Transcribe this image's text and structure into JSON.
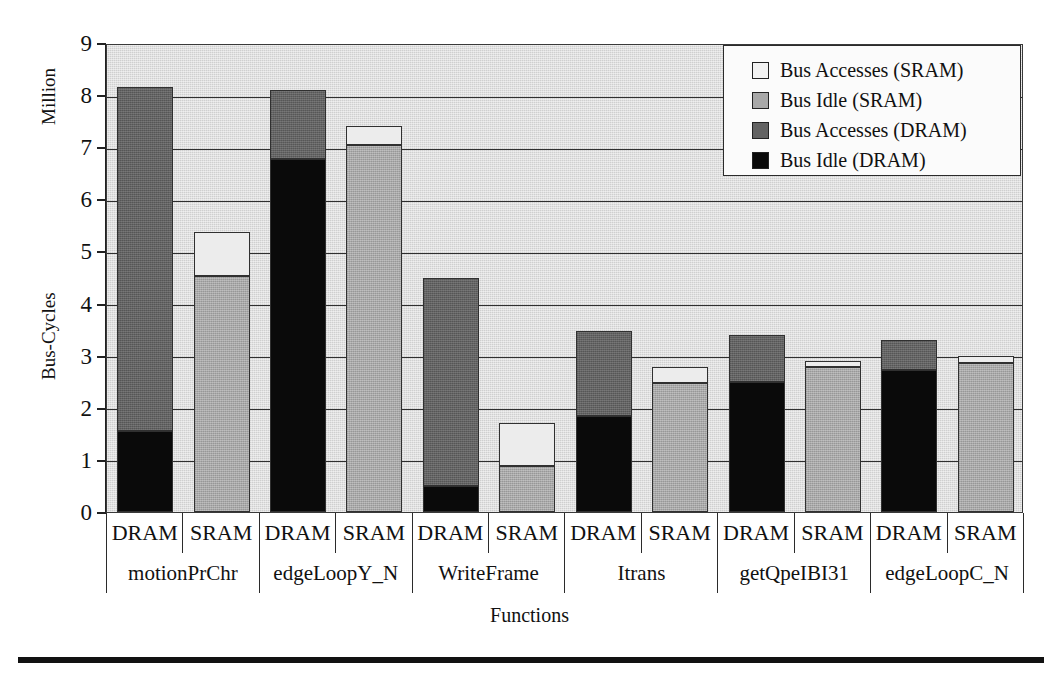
{
  "chart_data": {
    "type": "bar",
    "subtype": "stacked-grouped",
    "title": "",
    "xlabel": "Functions",
    "ylabel": "Bus-Cycles",
    "y_unit_label": "Million",
    "ylim": [
      0,
      9
    ],
    "yticks": [
      0,
      1,
      2,
      3,
      4,
      5,
      6,
      7,
      8,
      9
    ],
    "grid": true,
    "legend_position": "top-right",
    "legend": [
      {
        "label": "Bus Accesses (SRAM)",
        "color": "#f2f2f2",
        "key": "bus_accesses_sram"
      },
      {
        "label": "Bus Idle (SRAM)",
        "color": "#a8a8a8",
        "key": "bus_idle_sram"
      },
      {
        "label": "Bus Accesses (DRAM)",
        "color": "#636363",
        "key": "bus_accesses_dram"
      },
      {
        "label": "Bus Idle (DRAM)",
        "color": "#0a0a0a",
        "key": "bus_idle_dram"
      }
    ],
    "categories": [
      "motionPrChr",
      "edgeLoopY_N",
      "WriteFrame",
      "Itrans",
      "getQpeIBI31",
      "edgeLoopC_N"
    ],
    "memory_types": [
      "DRAM",
      "SRAM"
    ],
    "groups": [
      {
        "function": "motionPrChr",
        "bars": [
          {
            "memory": "DRAM",
            "segments": [
              {
                "key": "bus_idle_dram",
                "label": "Bus Idle (DRAM)",
                "value": 1.55
              },
              {
                "key": "bus_accesses_dram",
                "label": "Bus Accesses (DRAM)",
                "value": 6.6
              }
            ],
            "total": 8.15
          },
          {
            "memory": "SRAM",
            "segments": [
              {
                "key": "bus_idle_sram",
                "label": "Bus Idle (SRAM)",
                "value": 4.52
              },
              {
                "key": "bus_accesses_sram",
                "label": "Bus Accesses (SRAM)",
                "value": 0.85
              }
            ],
            "total": 5.37
          }
        ]
      },
      {
        "function": "edgeLoopY_N",
        "bars": [
          {
            "memory": "DRAM",
            "segments": [
              {
                "key": "bus_idle_dram",
                "label": "Bus Idle (DRAM)",
                "value": 6.78
              },
              {
                "key": "bus_accesses_dram",
                "label": "Bus Accesses (DRAM)",
                "value": 1.32
              }
            ],
            "total": 8.1
          },
          {
            "memory": "SRAM",
            "segments": [
              {
                "key": "bus_idle_sram",
                "label": "Bus Idle (SRAM)",
                "value": 7.05
              },
              {
                "key": "bus_accesses_sram",
                "label": "Bus Accesses (SRAM)",
                "value": 0.35
              }
            ],
            "total": 7.4
          }
        ]
      },
      {
        "function": "WriteFrame",
        "bars": [
          {
            "memory": "DRAM",
            "segments": [
              {
                "key": "bus_idle_dram",
                "label": "Bus Idle (DRAM)",
                "value": 0.5
              },
              {
                "key": "bus_accesses_dram",
                "label": "Bus Accesses (DRAM)",
                "value": 4.0
              }
            ],
            "total": 4.5
          },
          {
            "memory": "SRAM",
            "segments": [
              {
                "key": "bus_idle_sram",
                "label": "Bus Idle (SRAM)",
                "value": 0.88
              },
              {
                "key": "bus_accesses_sram",
                "label": "Bus Accesses (SRAM)",
                "value": 0.82
              }
            ],
            "total": 1.7
          }
        ]
      },
      {
        "function": "Itrans",
        "bars": [
          {
            "memory": "DRAM",
            "segments": [
              {
                "key": "bus_idle_dram",
                "label": "Bus Idle (DRAM)",
                "value": 1.85
              },
              {
                "key": "bus_accesses_dram",
                "label": "Bus Accesses (DRAM)",
                "value": 1.62
              }
            ],
            "total": 3.47
          },
          {
            "memory": "SRAM",
            "segments": [
              {
                "key": "bus_idle_sram",
                "label": "Bus Idle (SRAM)",
                "value": 2.48
              },
              {
                "key": "bus_accesses_sram",
                "label": "Bus Accesses (SRAM)",
                "value": 0.3
              }
            ],
            "total": 2.78
          }
        ]
      },
      {
        "function": "getQpeIBI31",
        "bars": [
          {
            "memory": "DRAM",
            "segments": [
              {
                "key": "bus_idle_dram",
                "label": "Bus Idle (DRAM)",
                "value": 2.5
              },
              {
                "key": "bus_accesses_dram",
                "label": "Bus Accesses (DRAM)",
                "value": 0.9
              }
            ],
            "total": 3.4
          },
          {
            "memory": "SRAM",
            "segments": [
              {
                "key": "bus_idle_sram",
                "label": "Bus Idle (SRAM)",
                "value": 2.78
              },
              {
                "key": "bus_accesses_sram",
                "label": "Bus Accesses (SRAM)",
                "value": 0.12
              }
            ],
            "total": 2.9
          }
        ]
      },
      {
        "function": "edgeLoopC_N",
        "bars": [
          {
            "memory": "DRAM",
            "segments": [
              {
                "key": "bus_idle_dram",
                "label": "Bus Idle (DRAM)",
                "value": 2.73
              },
              {
                "key": "bus_accesses_dram",
                "label": "Bus Accesses (DRAM)",
                "value": 0.57
              }
            ],
            "total": 3.3
          },
          {
            "memory": "SRAM",
            "segments": [
              {
                "key": "bus_idle_sram",
                "label": "Bus Idle (SRAM)",
                "value": 2.85
              },
              {
                "key": "bus_accesses_sram",
                "label": "Bus Accesses (SRAM)",
                "value": 0.15
              }
            ],
            "total": 3.0
          }
        ]
      }
    ]
  }
}
